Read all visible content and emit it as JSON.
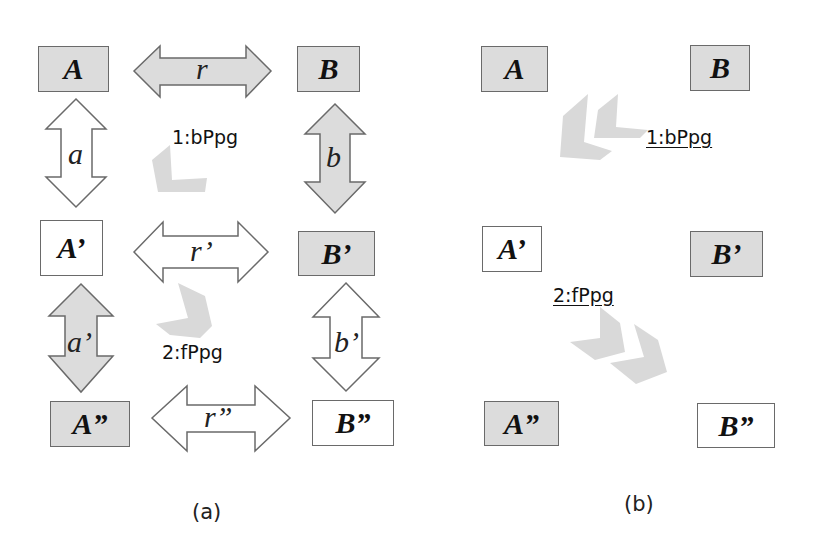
{
  "panel_a": {
    "boxes": {
      "A": "A",
      "B": "B",
      "A1": "A’",
      "B1": "B’",
      "A2": "A”",
      "B2": "B”"
    },
    "arrows": {
      "r": "r",
      "r1": "r’",
      "r2": "r”",
      "a": "a",
      "a1": "a’",
      "b": "b",
      "b1": "b’"
    },
    "propagation_labels": {
      "step1": "1:bPpg",
      "step2": "2:fPpg"
    },
    "caption": "(a)"
  },
  "panel_b": {
    "boxes": {
      "A": "A",
      "B": "B",
      "A1": "A’",
      "B1": "B’",
      "A2": "A”",
      "B2": "B”"
    },
    "propagation_labels": {
      "step1": "1:bPpg",
      "step2": "2:fPpg"
    },
    "caption": "(b)"
  },
  "colors": {
    "gray_fill": "#dcdcdc",
    "outline": "#6a6a6a",
    "chevron": "#d9d9d9"
  }
}
